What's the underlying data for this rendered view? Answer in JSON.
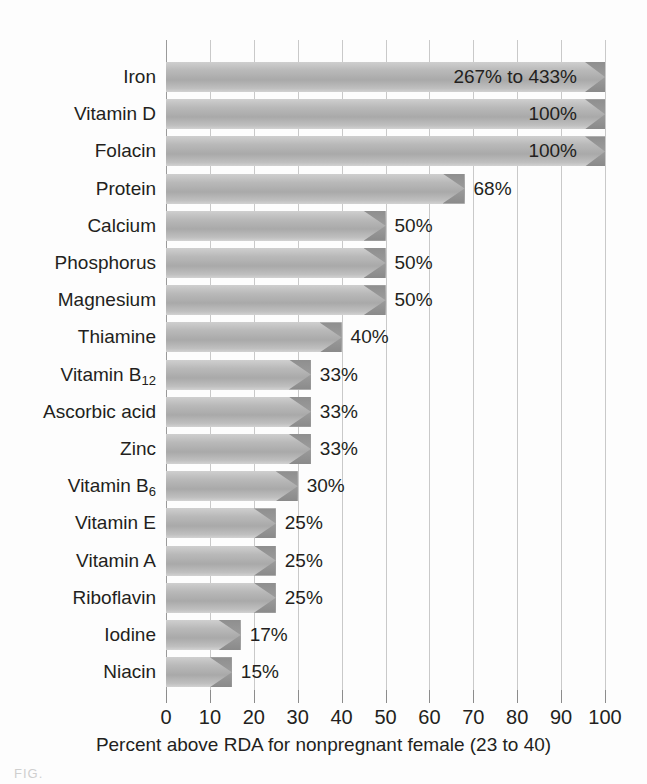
{
  "chart_data": {
    "type": "bar",
    "orientation": "horizontal",
    "title": "",
    "xlabel": "Percent above RDA for nonpregnant female (23 to 40)",
    "ylabel": "",
    "xlim": [
      0,
      100
    ],
    "xticks": [
      0,
      10,
      20,
      30,
      40,
      50,
      60,
      70,
      80,
      90,
      100
    ],
    "grid": true,
    "legend": "none",
    "categories": [
      "Iron",
      "Vitamin D",
      "Folacin",
      "Protein",
      "Calcium",
      "Phosphorus",
      "Magnesium",
      "Thiamine",
      "Vitamin B12",
      "Ascorbic acid",
      "Zinc",
      "Vitamin B6",
      "Vitamin E",
      "Vitamin A",
      "Riboflavin",
      "Iodine",
      "Niacin"
    ],
    "values": [
      100,
      100,
      100,
      68,
      50,
      50,
      50,
      40,
      33,
      33,
      33,
      30,
      25,
      25,
      25,
      17,
      15
    ],
    "data_labels": [
      "267% to 433%",
      "100%",
      "100%",
      "68%",
      "50%",
      "50%",
      "50%",
      "40%",
      "33%",
      "33%",
      "33%",
      "30%",
      "25%",
      "25%",
      "25%",
      "17%",
      "15%"
    ]
  },
  "labels": [
    {
      "main": "Iron",
      "sub": ""
    },
    {
      "main": "Vitamin D",
      "sub": ""
    },
    {
      "main": "Folacin",
      "sub": ""
    },
    {
      "main": "Protein",
      "sub": ""
    },
    {
      "main": "Calcium",
      "sub": ""
    },
    {
      "main": "Phosphorus",
      "sub": ""
    },
    {
      "main": "Magnesium",
      "sub": ""
    },
    {
      "main": "Thiamine",
      "sub": ""
    },
    {
      "main": "Vitamin B",
      "sub": "12"
    },
    {
      "main": "Ascorbic acid",
      "sub": ""
    },
    {
      "main": "Zinc",
      "sub": ""
    },
    {
      "main": "Vitamin B",
      "sub": "6"
    },
    {
      "main": "Vitamin E",
      "sub": ""
    },
    {
      "main": "Vitamin A",
      "sub": ""
    },
    {
      "main": "Riboflavin",
      "sub": ""
    },
    {
      "main": "Iodine",
      "sub": ""
    },
    {
      "main": "Niacin",
      "sub": ""
    }
  ],
  "axis": {
    "tick_labels": [
      "0",
      "10",
      "20",
      "30",
      "40",
      "50",
      "60",
      "70",
      "80",
      "90",
      "100"
    ],
    "caption": "Percent above RDA for nonpregnant female (23 to 40)"
  },
  "colors": {
    "bar_light": "#cfcfcf",
    "bar_mid": "#a9a9a9",
    "bar_tip": "#8f8f8f",
    "gridline": "#c9c9c9",
    "axis": "#8c8c8c",
    "text": "#231f20",
    "background": "#fdfdfd"
  },
  "figure_note": "FIG."
}
